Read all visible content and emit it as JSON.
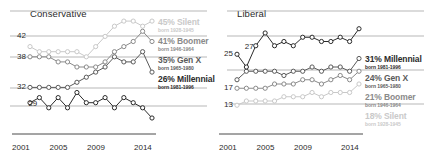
{
  "chart_data": {
    "type": "line",
    "xlabel": "",
    "ylabel": "",
    "x": [
      2001,
      2002,
      2003,
      2004,
      2005,
      2006,
      2007,
      2008,
      2009,
      2010,
      2011,
      2012,
      2013,
      2014
    ],
    "tick_labels": [
      "2001",
      "2005",
      "2009",
      "2014"
    ],
    "tick_values": [
      2001,
      2005,
      2009,
      2014
    ],
    "grid": false,
    "legend_position": "right",
    "marker": "open-circle",
    "panels": [
      {
        "name": "conservative",
        "title": "Conservative",
        "ylim": [
          26,
          46
        ],
        "y_axis_labels": [
          {
            "value": 42,
            "text": "42"
          },
          {
            "value": 38,
            "text": "38"
          },
          {
            "value": 32,
            "text": "32"
          }
        ],
        "inline_labels": [
          {
            "text": "29",
            "x": 2002,
            "value": 29
          }
        ],
        "reference_lines": [
          38,
          30.5
        ],
        "series": [
          {
            "name": "Silent",
            "label": "45% Silent",
            "born": "born 1928-1945",
            "end_value": 45,
            "color": "#c9c9c9",
            "values": [
              40,
              39,
              39,
              39,
              39,
              39,
              38,
              40,
              42,
              44,
              45,
              45,
              44,
              45
            ]
          },
          {
            "name": "Boomer",
            "label": "41% Boomer",
            "born": "born 1946-1964",
            "end_value": 41,
            "color": "#8a8a8a",
            "values": [
              38,
              38,
              38,
              37,
              37,
              36,
              36,
              36,
              37,
              39,
              40,
              41,
              43,
              41
            ]
          },
          {
            "name": "Gen X",
            "label": "35% Gen X",
            "born": "born 1965-1980",
            "end_value": 35,
            "color": "#5a5a5a",
            "values": [
              32,
              32,
              32,
              32,
              32,
              33,
              34,
              35,
              36,
              38,
              37,
              37,
              39,
              35
            ]
          },
          {
            "name": "Millennial",
            "label": "26% Millennial",
            "born": "born 1981-1996",
            "end_value": 26,
            "color": "#2b2b2b",
            "values": [
              29,
              30,
              28,
              30,
              28,
              31,
              29,
              29,
              30,
              28,
              30,
              29,
              28,
              26
            ]
          }
        ]
      },
      {
        "name": "liberal",
        "title": "Liberal",
        "ylim": [
          10,
          34
        ],
        "y_axis_labels": [
          {
            "value": 25,
            "text": "25"
          },
          {
            "value": 17,
            "text": "17"
          },
          {
            "value": 13,
            "text": "13"
          }
        ],
        "inline_labels": [
          {
            "text": "27",
            "x": 2003,
            "value": 27
          }
        ],
        "reference_lines": [
          28,
          17
        ],
        "series": [
          {
            "name": "Millennial",
            "label": "31% Millennial",
            "born": "born 1981-1996",
            "end_value": 31,
            "color": "#2b2b2b",
            "values": [
              25,
              22,
              27,
              30,
              27,
              28,
              27,
              29,
              29,
              28,
              28,
              29,
              28,
              31
            ]
          },
          {
            "name": "Gen X",
            "label": "24% Gen X",
            "born": "born 1965-1980",
            "end_value": 24,
            "color": "#5a5a5a",
            "values": [
              19,
              21,
              21,
              21,
              21,
              20,
              21,
              21,
              22,
              21,
              22,
              22,
              21,
              24
            ]
          },
          {
            "name": "Boomer",
            "label": "21% Boomer",
            "born": "born 1946-1964",
            "end_value": 21,
            "color": "#8a8a8a",
            "values": [
              17,
              17,
              17,
              17,
              18,
              18,
              18,
              19,
              19,
              18,
              19,
              20,
              19,
              21
            ]
          },
          {
            "name": "Silent",
            "label": "18% Silent",
            "born": "born 1928-1945",
            "end_value": 18,
            "color": "#c9c9c9",
            "values": [
              13,
              14,
              14,
              14,
              14,
              15,
              15,
              15,
              16,
              15,
              16,
              16,
              16,
              18
            ]
          }
        ]
      }
    ]
  }
}
